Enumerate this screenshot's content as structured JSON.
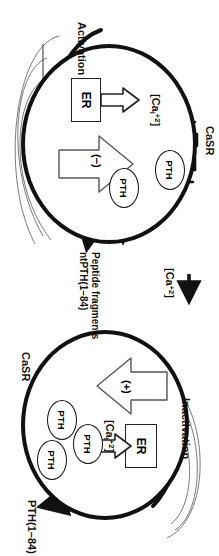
{
  "figure": {
    "type": "biological-pathway-diagram",
    "orientation": "rotated-90-clockwise"
  },
  "panels": [
    {
      "id": "inactivation",
      "state_label": "Inactivation",
      "receptor_label": "CaSR",
      "organelle_label": "ER",
      "intracellular_calcium_label": "[Ca",
      "intracellular_calcium_sub": "i",
      "intracellular_calcium_sup": "+2",
      "modulator_sign": "(+)",
      "vesicles": [
        "PTH",
        "PTH",
        "PTH"
      ],
      "secretion_label": "PTH(1–84)",
      "secretion_blocked": true,
      "block_marker": "X"
    },
    {
      "id": "activation",
      "state_label": "Activation",
      "receptor_label": "CaSR",
      "organelle_label": "ER",
      "intracellular_calcium_label": "[Ca",
      "intracellular_calcium_sub": "i",
      "intracellular_calcium_sup": "+2",
      "modulator_sign": "(−)",
      "vesicles": [
        "PTH",
        "PTH"
      ],
      "product_line1": "Peptide fragments",
      "product_line2": "ntPTH(1–84)",
      "secretion_blocked": false
    }
  ],
  "extracellular": {
    "calcium_label": "[Ca",
    "calcium_sup": "+2",
    "arrow_icon": "right-arrow-icon"
  },
  "colors": {
    "ink": "#111111",
    "halo": "#7a7a7a",
    "paper": "#ffffff"
  }
}
